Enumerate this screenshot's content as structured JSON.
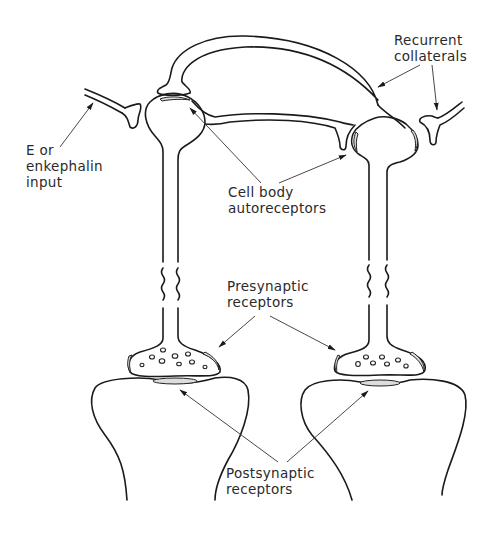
{
  "diagram": {
    "type": "neuron schematic",
    "labels": {
      "recurrent_collaterals": [
        "Recurrent",
        "collaterals"
      ],
      "input": [
        "E or",
        "enkephalin",
        "input"
      ],
      "cell_body_autoreceptors": [
        "Cell body",
        "autoreceptors"
      ],
      "presynaptic_receptors": [
        "Presynaptic",
        "receptors"
      ],
      "postsynaptic_receptors": [
        "Postsynaptic",
        "receptors"
      ]
    },
    "colors": {
      "line": "#1a1a1a",
      "text": "#2a2a2a",
      "background": "#ffffff"
    }
  }
}
